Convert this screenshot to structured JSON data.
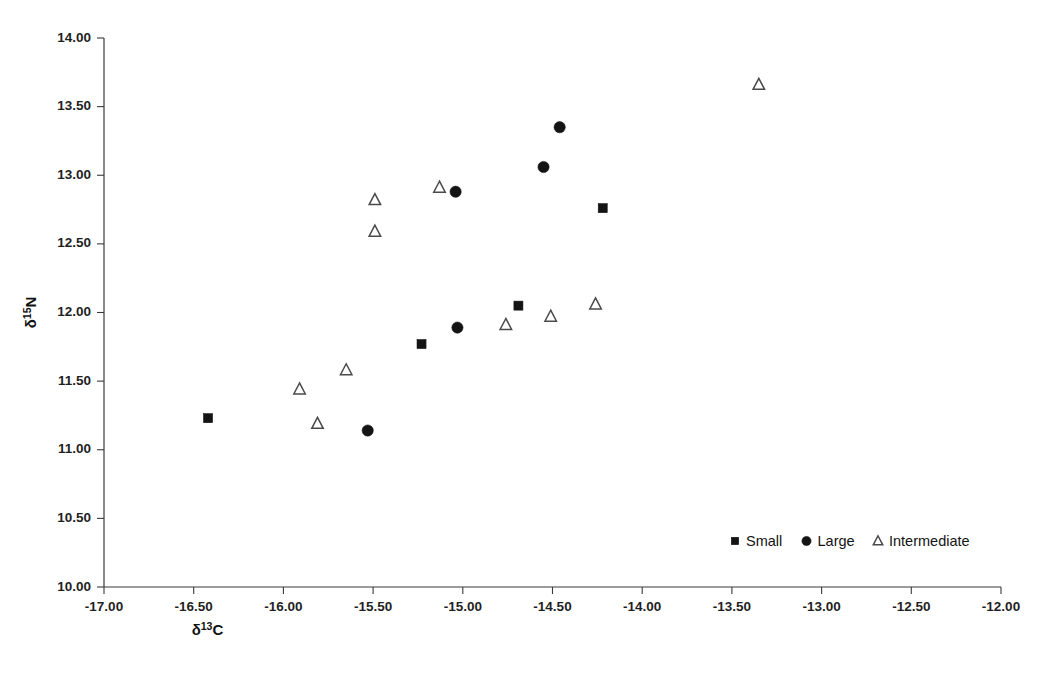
{
  "chart_data": {
    "type": "scatter",
    "title": "",
    "xlabel": "δ¹³C",
    "ylabel": "δ¹⁵N",
    "xlabel_base": "δ",
    "xlabel_sup": "13",
    "xlabel_tail": "C",
    "ylabel_base": "δ",
    "ylabel_sup": "15",
    "ylabel_tail": "N",
    "xlim": [
      -17.0,
      -12.0
    ],
    "ylim": [
      10.0,
      14.0
    ],
    "xticks": [
      -17.0,
      -16.5,
      -16.0,
      -15.5,
      -15.0,
      -14.5,
      -14.0,
      -13.5,
      -13.0,
      -12.5,
      -12.0
    ],
    "yticks": [
      10.0,
      10.5,
      11.0,
      11.5,
      12.0,
      12.5,
      13.0,
      13.5,
      14.0
    ],
    "xtick_labels": [
      "-17.00",
      "-16.50",
      "-16.00",
      "-15.50",
      "-15.00",
      "-14.50",
      "-14.00",
      "-13.50",
      "-13.00",
      "-12.50",
      "-12.00"
    ],
    "ytick_labels": [
      "10.00",
      "10.50",
      "11.00",
      "11.50",
      "12.00",
      "12.50",
      "13.00",
      "13.50",
      "14.00"
    ],
    "grid": false,
    "legend_position": "bottom-right",
    "marker_color": "#141414",
    "open_marker_stroke": "#4a4a4a",
    "axis_color": "#3a3a3a",
    "series": [
      {
        "name": "Small",
        "marker": "filled-square",
        "points": [
          {
            "x": -16.42,
            "y": 11.23
          },
          {
            "x": -15.23,
            "y": 11.77
          },
          {
            "x": -14.69,
            "y": 12.05
          },
          {
            "x": -14.22,
            "y": 12.76
          }
        ]
      },
      {
        "name": "Large",
        "marker": "filled-circle",
        "points": [
          {
            "x": -15.53,
            "y": 11.14
          },
          {
            "x": -15.03,
            "y": 11.89
          },
          {
            "x": -15.04,
            "y": 12.88
          },
          {
            "x": -14.55,
            "y": 13.06
          },
          {
            "x": -14.46,
            "y": 13.35
          }
        ]
      },
      {
        "name": "Intermediate",
        "marker": "open-triangle",
        "points": [
          {
            "x": -15.91,
            "y": 11.44
          },
          {
            "x": -15.81,
            "y": 11.19
          },
          {
            "x": -15.65,
            "y": 11.58
          },
          {
            "x": -15.49,
            "y": 12.59
          },
          {
            "x": -15.49,
            "y": 12.82
          },
          {
            "x": -15.13,
            "y": 12.91
          },
          {
            "x": -14.76,
            "y": 11.91
          },
          {
            "x": -14.51,
            "y": 11.97
          },
          {
            "x": -14.26,
            "y": 12.06
          },
          {
            "x": -13.35,
            "y": 13.66
          }
        ]
      }
    ],
    "legend": [
      {
        "label": "Small",
        "marker": "filled-square"
      },
      {
        "label": "Large",
        "marker": "filled-circle"
      },
      {
        "label": "Intermediate",
        "marker": "open-triangle"
      }
    ]
  }
}
